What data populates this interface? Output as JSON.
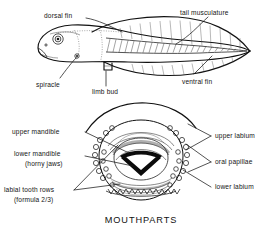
{
  "figure": {
    "background_color": "#ffffff",
    "ink_color": "#141414"
  },
  "top_diagram": {
    "name": "tadpole-lateral-view",
    "labels": [
      {
        "id": "dorsal-fin",
        "text": "dorsal fin",
        "x": 44,
        "y": 16,
        "anchor": "start"
      },
      {
        "id": "tail-musculature",
        "text": "tail musculature",
        "x": 182,
        "y": 13,
        "anchor": "start"
      },
      {
        "id": "spiracle",
        "text": "spiracle",
        "x": 40,
        "y": 83,
        "anchor": "start"
      },
      {
        "id": "limb-bud",
        "text": "limb bud",
        "x": 95,
        "y": 90,
        "anchor": "start"
      },
      {
        "id": "ventral-fin",
        "text": "ventral fin",
        "x": 182,
        "y": 79,
        "anchor": "start"
      }
    ]
  },
  "bottom_diagram": {
    "name": "mouthparts-view",
    "caption": "MOUTHPARTS",
    "labels_left": [
      {
        "id": "upper-mandible",
        "lines": [
          "upper mandible"
        ],
        "x": 12,
        "y": 134
      },
      {
        "id": "lower-mandible",
        "lines": [
          "lower mandible",
          "(horny jaws)"
        ],
        "x": 12,
        "y": 158
      },
      {
        "id": "labial-tooth-rows",
        "lines": [
          "labial tooth rows",
          "(formula 2/3)"
        ],
        "x": 5,
        "y": 193
      }
    ],
    "labels_right": [
      {
        "id": "upper-labium",
        "lines": [
          "upper labium"
        ],
        "x": 214,
        "y": 138
      },
      {
        "id": "oral-papillae",
        "lines": [
          "oral papillae"
        ],
        "x": 214,
        "y": 165
      },
      {
        "id": "lower-labium",
        "lines": [
          "lower labium"
        ],
        "x": 214,
        "y": 190
      }
    ]
  }
}
